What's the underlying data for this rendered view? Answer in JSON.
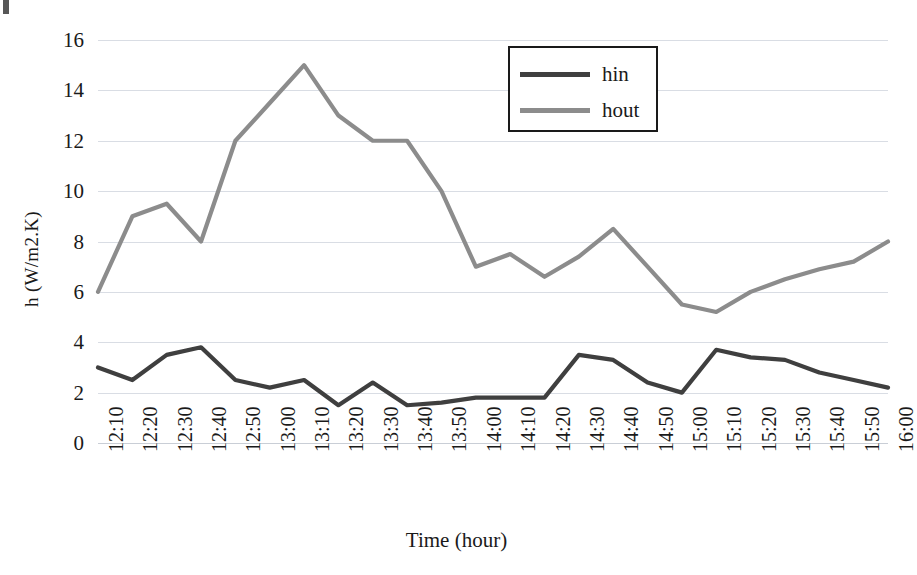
{
  "chart_data": {
    "type": "line",
    "title": "",
    "xlabel": "Time (hour)",
    "ylabel": "h (W/m2.K)",
    "ylim": [
      0,
      16
    ],
    "yticks": [
      0,
      2,
      4,
      6,
      8,
      10,
      12,
      14,
      16
    ],
    "grid": true,
    "legend_position": "top-center-right",
    "categories": [
      "12:10",
      "12:20",
      "12:30",
      "12:40",
      "12:50",
      "13:00",
      "13:10",
      "13:20",
      "13:30",
      "13:40",
      "13:50",
      "14:00",
      "14:10",
      "14:20",
      "14:30",
      "14:40",
      "14:50",
      "15:00",
      "15:10",
      "15:20",
      "15:30",
      "15:40",
      "15:50",
      "16:00"
    ],
    "series": [
      {
        "name": "hin",
        "color": "#3f3f3f",
        "values": [
          3.0,
          2.5,
          3.5,
          3.8,
          2.5,
          2.2,
          2.5,
          1.5,
          2.4,
          1.5,
          1.6,
          1.8,
          1.8,
          1.8,
          3.5,
          3.3,
          2.4,
          2.0,
          3.7,
          3.4,
          3.3,
          2.8,
          2.5,
          2.2
        ]
      },
      {
        "name": "hout",
        "color": "#8c8c8c",
        "values": [
          6.0,
          9.0,
          9.5,
          8.0,
          12.0,
          13.5,
          15.0,
          13.0,
          12.0,
          12.0,
          10.0,
          7.0,
          7.5,
          6.6,
          7.4,
          8.5,
          7.0,
          5.5,
          5.2,
          6.0,
          6.5,
          6.9,
          7.2,
          8.0
        ]
      }
    ]
  },
  "legend": {
    "items": [
      {
        "label": "hin",
        "color": "#3f3f3f"
      },
      {
        "label": "hout",
        "color": "#8c8c8c"
      }
    ]
  },
  "axes": {
    "y_title": "h (W/m2.K)",
    "x_title": "Time (hour)"
  },
  "colors": {
    "gridline": "#d9dde4",
    "hin": "#3f3f3f",
    "hout": "#8c8c8c",
    "text": "#1a1a1a",
    "legend_border": "#1a1a1a"
  }
}
